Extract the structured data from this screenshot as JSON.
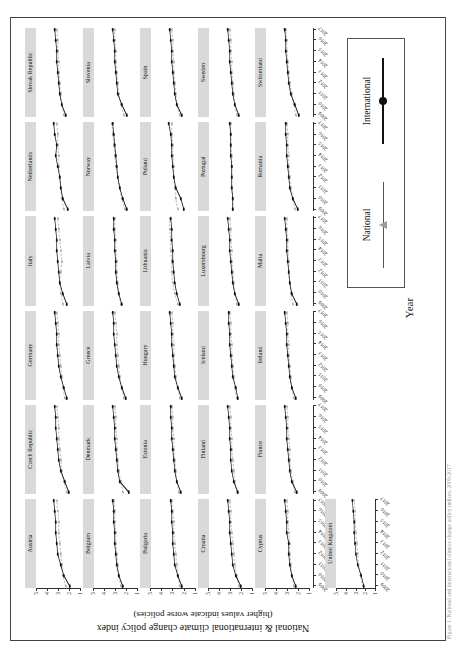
{
  "figure": {
    "xlabel": "Year",
    "ylabel_line1": "National & international climate change policy index",
    "ylabel_line2": "(higher values indicate worse policies)",
    "caption": "Figure 1. National and international climate change policy indices, 2009-2017"
  },
  "legend": {
    "items": [
      {
        "label": "National",
        "marker": "triangle-marker",
        "color": "#9b9b9b",
        "line": "thin"
      },
      {
        "label": "International",
        "marker": "circle-marker",
        "color": "#111111",
        "line": "thick"
      }
    ]
  },
  "chart_data": {
    "type": "line",
    "title": "National & international climate change policy index",
    "xlabel": "Year",
    "ylabel": "National & international climate change policy index (higher values indicate worse policies)",
    "ylim": [
      1,
      5
    ],
    "yticks": [
      1,
      2,
      3,
      4,
      5
    ],
    "x": [
      2009,
      2010,
      2011,
      2012,
      2013,
      2014,
      2015,
      2016,
      2017
    ],
    "xticklabels": [
      "2009",
      "2010",
      "2011",
      "2012",
      "2013",
      "2014",
      "2015",
      "2016",
      "2017"
    ],
    "grid": false,
    "legend_position": "bottom-right",
    "series_names": [
      "National",
      "International"
    ],
    "series_colors": {
      "National": "#9b9b9b",
      "International": "#111111"
    },
    "panel_layout": {
      "rows": 6,
      "cols": 6,
      "note": "last row has a single panel (United Kingdom)"
    },
    "panels": [
      {
        "name": "Austria",
        "national": [
          2.3,
          2.6,
          2.7,
          2.8,
          2.9,
          3.0,
          3.0,
          3.1,
          3.2
        ],
        "international": [
          1.9,
          2.5,
          2.8,
          3.1,
          3.2,
          3.3,
          3.3,
          3.4,
          3.5
        ]
      },
      {
        "name": "Belgium",
        "national": [
          2.6,
          2.8,
          2.9,
          3.0,
          3.1,
          3.1,
          3.2,
          3.2,
          3.3
        ],
        "international": [
          2.4,
          2.8,
          3.0,
          3.1,
          3.2,
          3.2,
          3.3,
          3.3,
          3.4
        ]
      },
      {
        "name": "Bulgaria",
        "national": [
          2.4,
          2.6,
          2.7,
          2.8,
          2.9,
          3.0,
          3.0,
          3.1,
          3.2
        ],
        "international": [
          2.2,
          2.6,
          2.9,
          3.0,
          3.1,
          3.1,
          3.2,
          3.2,
          3.3
        ]
      },
      {
        "name": "Croatia",
        "national": [
          2.3,
          2.5,
          2.7,
          2.8,
          2.9,
          3.0,
          3.1,
          3.1,
          3.2
        ],
        "international": [
          2.1,
          2.6,
          2.9,
          3.0,
          3.1,
          3.2,
          3.2,
          3.3,
          3.4
        ]
      },
      {
        "name": "Cyprus",
        "national": [
          2.5,
          2.7,
          2.8,
          2.9,
          2.9,
          3.0,
          3.1,
          3.1,
          3.2
        ],
        "international": [
          2.3,
          2.7,
          2.9,
          3.0,
          3.0,
          3.2,
          3.2,
          3.3,
          3.4
        ]
      },
      {
        "name": "Czech Republic",
        "national": [
          2.2,
          2.5,
          2.7,
          2.8,
          2.9,
          3.0,
          3.0,
          3.1,
          3.2
        ],
        "international": [
          2.0,
          2.4,
          2.8,
          3.0,
          3.1,
          3.2,
          3.3,
          3.3,
          3.4
        ]
      },
      {
        "name": "Denmark",
        "national": [
          2.4,
          2.6,
          2.8,
          2.9,
          3.0,
          3.0,
          3.1,
          3.1,
          3.2
        ],
        "international": [
          1.8,
          2.7,
          2.9,
          3.0,
          3.1,
          3.2,
          3.2,
          3.3,
          3.4
        ]
      },
      {
        "name": "Estonia",
        "national": [
          2.5,
          2.7,
          2.8,
          2.9,
          3.0,
          3.0,
          3.1,
          3.1,
          3.2
        ],
        "international": [
          2.3,
          2.7,
          2.9,
          3.0,
          3.1,
          3.2,
          3.2,
          3.3,
          3.3
        ]
      },
      {
        "name": "Finland",
        "national": [
          2.5,
          2.7,
          2.8,
          2.9,
          3.0,
          3.0,
          3.1,
          3.1,
          3.2
        ],
        "international": [
          2.4,
          2.8,
          3.0,
          3.1,
          3.1,
          3.2,
          3.2,
          3.3,
          3.4
        ]
      },
      {
        "name": "France",
        "national": [
          2.4,
          2.6,
          2.8,
          2.9,
          2.9,
          3.0,
          3.1,
          3.1,
          3.2
        ],
        "international": [
          2.2,
          2.7,
          2.9,
          3.0,
          3.1,
          3.2,
          3.2,
          3.3,
          3.4
        ]
      },
      {
        "name": "Germany",
        "national": [
          2.4,
          2.6,
          2.7,
          2.8,
          2.9,
          3.0,
          3.0,
          3.1,
          3.2
        ],
        "international": [
          2.2,
          2.5,
          2.8,
          3.0,
          3.1,
          3.2,
          3.2,
          3.3,
          3.4
        ]
      },
      {
        "name": "Greece",
        "national": [
          2.3,
          2.5,
          2.7,
          2.8,
          2.9,
          3.0,
          3.0,
          3.1,
          3.2
        ],
        "international": [
          2.1,
          2.5,
          2.8,
          3.0,
          3.1,
          3.2,
          3.3,
          3.3,
          3.4
        ]
      },
      {
        "name": "Hungary",
        "national": [
          2.4,
          2.6,
          2.8,
          2.9,
          3.0,
          3.0,
          3.1,
          3.1,
          3.2
        ],
        "international": [
          2.2,
          2.6,
          2.9,
          3.0,
          3.1,
          3.2,
          3.2,
          3.3,
          3.4
        ]
      },
      {
        "name": "Iceland",
        "national": [
          2.5,
          2.7,
          2.8,
          2.9,
          3.0,
          3.0,
          3.1,
          3.1,
          3.2
        ],
        "international": [
          2.4,
          2.6,
          2.9,
          3.0,
          3.1,
          3.2,
          3.2,
          3.3,
          3.3
        ]
      },
      {
        "name": "Ireland",
        "national": [
          2.5,
          2.7,
          2.8,
          2.9,
          3.0,
          3.0,
          3.1,
          3.1,
          3.2
        ],
        "international": [
          2.3,
          2.7,
          2.9,
          3.0,
          3.1,
          3.2,
          3.2,
          3.3,
          3.4
        ]
      },
      {
        "name": "Italy",
        "national": [
          2.6,
          2.8,
          2.9,
          2.8,
          2.7,
          2.8,
          2.9,
          3.0,
          3.1
        ],
        "international": [
          2.2,
          2.6,
          2.9,
          3.0,
          3.1,
          3.2,
          3.2,
          3.3,
          3.4
        ]
      },
      {
        "name": "Latvia",
        "national": [
          2.6,
          2.8,
          2.9,
          3.0,
          3.0,
          3.1,
          3.1,
          3.2,
          3.2
        ],
        "international": [
          2.5,
          2.8,
          3.0,
          3.1,
          3.1,
          3.2,
          3.2,
          3.3,
          3.3
        ]
      },
      {
        "name": "Lithuania",
        "national": [
          2.6,
          2.9,
          3.1,
          3.2,
          3.2,
          3.3,
          3.3,
          3.4,
          3.4
        ],
        "international": [
          2.4,
          2.7,
          2.9,
          3.0,
          3.1,
          3.1,
          3.2,
          3.2,
          3.3
        ]
      },
      {
        "name": "Luxembourg",
        "national": [
          2.5,
          2.7,
          2.8,
          2.9,
          3.0,
          3.0,
          3.1,
          3.1,
          3.2
        ],
        "international": [
          2.3,
          2.7,
          2.9,
          3.0,
          3.1,
          3.2,
          3.2,
          3.3,
          3.4
        ]
      },
      {
        "name": "Malta",
        "national": [
          2.6,
          2.8,
          2.9,
          3.0,
          3.0,
          3.1,
          3.1,
          3.2,
          3.2
        ],
        "international": [
          2.2,
          2.7,
          2.9,
          3.0,
          3.1,
          3.2,
          3.2,
          3.3,
          3.4
        ]
      },
      {
        "name": "Netherlands",
        "national": [
          2.5,
          2.7,
          2.8,
          2.9,
          3.0,
          3.0,
          3.1,
          3.1,
          3.2
        ],
        "international": [
          2.1,
          2.6,
          2.8,
          2.9,
          3.1,
          3.3,
          3.2,
          3.4,
          3.5
        ]
      },
      {
        "name": "Norway",
        "national": [
          2.2,
          2.5,
          2.7,
          2.9,
          3.1,
          3.2,
          3.3,
          3.4,
          3.5
        ],
        "international": [
          2.0,
          2.4,
          2.7,
          2.9,
          3.0,
          3.1,
          3.2,
          3.3,
          3.4
        ]
      },
      {
        "name": "Poland",
        "national": [
          2.6,
          2.8,
          2.9,
          3.0,
          3.0,
          3.1,
          3.1,
          3.2,
          3.2
        ],
        "international": [
          2.0,
          2.3,
          2.8,
          3.0,
          3.1,
          3.2,
          3.2,
          3.3,
          3.5
        ]
      },
      {
        "name": "Portugal",
        "national": [
          2.9,
          2.9,
          3.0,
          3.0,
          3.0,
          3.0,
          3.1,
          3.1,
          3.1
        ],
        "international": [
          2.9,
          2.9,
          3.0,
          3.0,
          3.0,
          3.1,
          3.1,
          3.1,
          3.2
        ]
      },
      {
        "name": "Romania",
        "national": [
          2.4,
          2.6,
          2.8,
          2.9,
          3.0,
          3.0,
          3.1,
          3.1,
          3.2
        ],
        "international": [
          2.1,
          2.6,
          2.9,
          3.0,
          3.1,
          3.2,
          3.2,
          3.3,
          3.3
        ]
      },
      {
        "name": "Slovak Republic",
        "national": [
          2.5,
          2.7,
          2.8,
          2.9,
          3.0,
          3.0,
          3.1,
          3.1,
          3.2
        ],
        "international": [
          2.3,
          2.7,
          2.9,
          3.0,
          3.1,
          3.2,
          3.2,
          3.3,
          3.4
        ]
      },
      {
        "name": "Slovenia",
        "national": [
          2.3,
          2.6,
          2.8,
          2.9,
          3.0,
          3.1,
          3.1,
          3.2,
          3.2
        ],
        "international": [
          2.0,
          2.5,
          2.9,
          3.0,
          3.1,
          3.2,
          3.2,
          3.3,
          3.4
        ]
      },
      {
        "name": "Spain",
        "national": [
          2.4,
          2.7,
          2.8,
          2.9,
          3.0,
          3.0,
          3.1,
          3.1,
          3.2
        ],
        "international": [
          2.2,
          2.7,
          2.9,
          3.0,
          3.1,
          3.2,
          3.2,
          3.3,
          3.4
        ]
      },
      {
        "name": "Sweden",
        "national": [
          2.5,
          2.7,
          2.8,
          2.9,
          3.0,
          3.0,
          3.1,
          3.1,
          3.2
        ],
        "international": [
          2.3,
          2.7,
          2.9,
          3.0,
          3.1,
          3.2,
          3.2,
          3.3,
          3.4
        ]
      },
      {
        "name": "Switzerland",
        "national": [
          2.3,
          2.5,
          2.7,
          2.9,
          3.0,
          3.1,
          3.2,
          3.2,
          3.3
        ],
        "international": [
          2.0,
          2.4,
          2.8,
          3.0,
          3.1,
          3.2,
          3.3,
          3.3,
          3.4
        ]
      },
      {
        "name": "United Kingdom",
        "national": [
          2.2,
          2.5,
          2.7,
          2.8,
          2.9,
          3.0,
          3.1,
          3.1,
          3.2
        ],
        "international": [
          2.1,
          2.4,
          2.8,
          3.0,
          3.1,
          3.2,
          3.2,
          3.3,
          3.4
        ]
      }
    ]
  }
}
